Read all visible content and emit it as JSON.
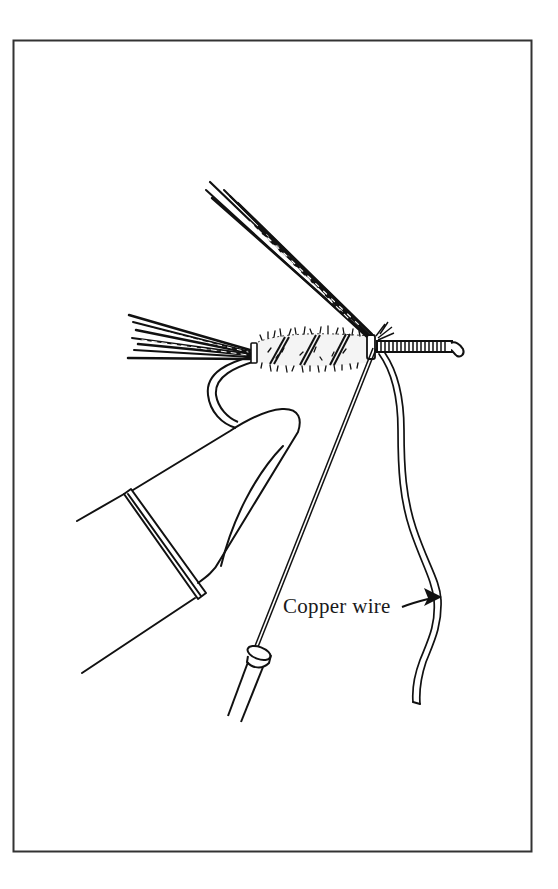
{
  "figure": {
    "type": "line-art illustration",
    "colors": {
      "ink": "#111111",
      "frame": "#333333",
      "background": "#ffffff"
    }
  },
  "labels": {
    "copper_wire": "Copper wire"
  },
  "annotations": [
    {
      "text": "Copper wire",
      "arrow": "right",
      "points_to": "copper-wire"
    }
  ]
}
